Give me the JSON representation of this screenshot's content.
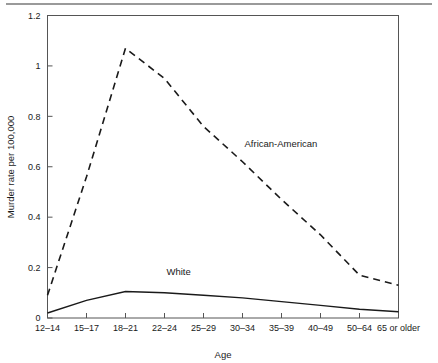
{
  "chart_data": {
    "type": "line",
    "title": "",
    "subtitle": "",
    "xlabel": "Age",
    "ylabel": "Murder rate per 100,000",
    "categories": [
      "12–14",
      "15–17",
      "18–21",
      "22–24",
      "25–29",
      "30–34",
      "35–39",
      "40–49",
      "50–64",
      "65 or older"
    ],
    "ylim": [
      0,
      1.2
    ],
    "ytick_labels": [
      "0",
      "0.2",
      "0.4",
      "0.6",
      "0.8",
      "1",
      "1.2"
    ],
    "ytick_values": [
      0,
      0.2,
      0.4,
      0.6,
      0.8,
      1,
      1.2
    ],
    "grid": false,
    "legend_position": "inline-annotations",
    "series": [
      {
        "name": "African-American",
        "style": "dashed",
        "color": "#1a1a1a",
        "values": [
          0.09,
          0.56,
          1.07,
          0.95,
          0.76,
          0.62,
          0.47,
          0.33,
          0.17,
          0.13
        ]
      },
      {
        "name": "White",
        "style": "solid",
        "color": "#1a1a1a",
        "values": [
          0.02,
          0.07,
          0.105,
          0.1,
          0.09,
          0.08,
          0.065,
          0.05,
          0.035,
          0.025
        ]
      }
    ],
    "annotations": [
      {
        "text": "African-American",
        "x_category": "30–34",
        "y_value": 0.68
      },
      {
        "text": "White",
        "x_category": "22–24",
        "y_value": 0.17
      }
    ]
  },
  "axes": {
    "y_title": "Murder rate per 100,000",
    "x_title": "Age"
  },
  "colors": {
    "line": "#1a1a1a",
    "frame": "#555555",
    "rule": "#9a9a9a",
    "background": "#ffffff"
  }
}
